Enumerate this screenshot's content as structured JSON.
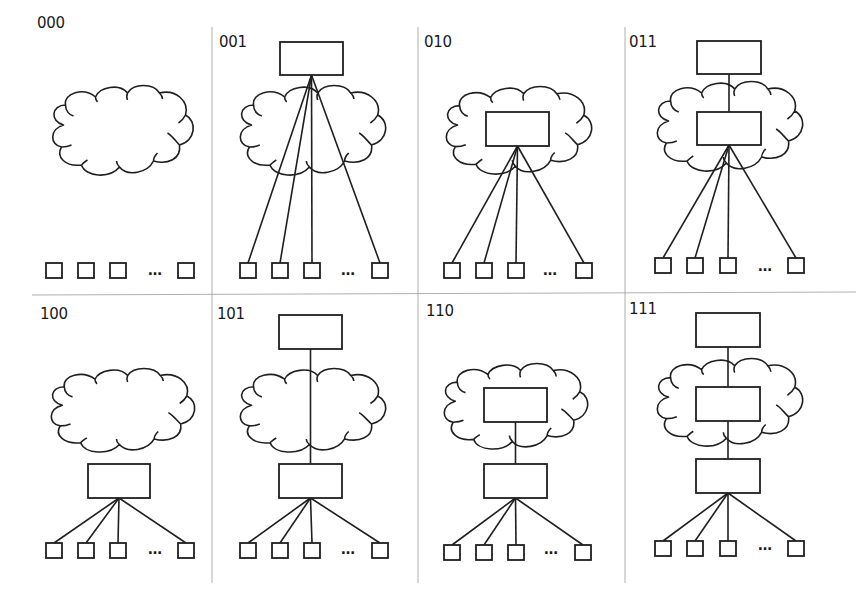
{
  "panels": [
    {
      "id": "000",
      "label": "000",
      "top_box": false,
      "cloud_box": false,
      "bottom_box": false,
      "fan_from": "none"
    },
    {
      "id": "001",
      "label": "001",
      "top_box": true,
      "cloud_box": false,
      "bottom_box": false,
      "fan_from": "top"
    },
    {
      "id": "010",
      "label": "010",
      "top_box": false,
      "cloud_box": true,
      "bottom_box": false,
      "fan_from": "cloud"
    },
    {
      "id": "011",
      "label": "011",
      "top_box": true,
      "cloud_box": true,
      "bottom_box": false,
      "fan_from": "cloud"
    },
    {
      "id": "100",
      "label": "100",
      "top_box": false,
      "cloud_box": false,
      "bottom_box": true,
      "fan_from": "bottom"
    },
    {
      "id": "101",
      "label": "101",
      "top_box": true,
      "cloud_box": false,
      "bottom_box": true,
      "fan_from": "bottom"
    },
    {
      "id": "110",
      "label": "110",
      "top_box": false,
      "cloud_box": true,
      "bottom_box": true,
      "fan_from": "bottom"
    },
    {
      "id": "111",
      "label": "111",
      "top_box": true,
      "cloud_box": true,
      "bottom_box": true,
      "fan_from": "bottom"
    }
  ],
  "ellipsis": "…",
  "colors": {
    "stroke": "#1f1f1f",
    "divider": "#9a9a9a",
    "background": "#ffffff"
  }
}
